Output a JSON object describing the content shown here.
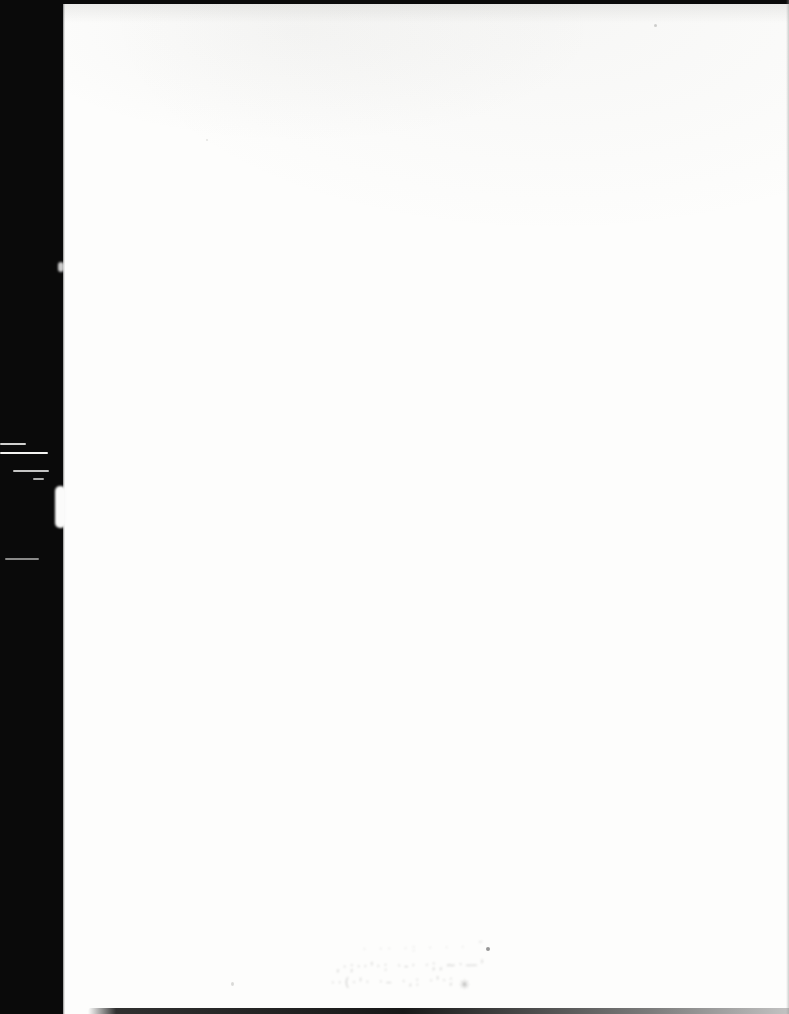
{
  "colors": {
    "paper": "#fdfdfc",
    "scan_black": "#0a0a0a",
    "smudge": "#7d7d7b",
    "edge_gray": "#bdbdbb"
  },
  "scan": {
    "smudge_lines": {
      "l1": "· ··  ·: ·   ·  · ˝",
      "l2": ",·;··'·: ·-· ·;,~·—'",
      "l3": "··(·'· ·– ·,: ·'·;"
    },
    "smudge_star_glyph": "✳"
  }
}
